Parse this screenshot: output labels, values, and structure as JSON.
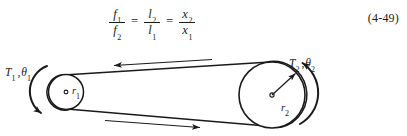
{
  "equation": {
    "id": "4-49",
    "number_label": "(4-49)",
    "relation": "f1/f2 = l2/l1 = x2/x1",
    "terms": [
      {
        "numerator_symbol": "f",
        "numerator_sub": "1",
        "denominator_symbol": "f",
        "denominator_sub": "2"
      },
      {
        "numerator_symbol": "l",
        "numerator_sub": "2",
        "denominator_symbol": "l",
        "denominator_sub": "1"
      },
      {
        "numerator_symbol": "x",
        "numerator_sub": "2",
        "denominator_symbol": "x",
        "denominator_sub": "1"
      }
    ],
    "operators": [
      "=",
      "="
    ]
  },
  "figure": {
    "type": "belt-and-pulley-drive",
    "labels": {
      "left_torque_symbol": "T",
      "left_torque_sub": "1",
      "left_angle_symbol": "θ",
      "left_angle_sub": "1",
      "right_torque_symbol": "T",
      "right_torque_sub": "2",
      "right_angle_symbol": "θ",
      "right_angle_sub": "2",
      "left_radius_symbol": "r",
      "left_radius_sub": "1",
      "right_radius_symbol": "r",
      "right_radius_sub": "2",
      "separator": ","
    },
    "pulleys": [
      {
        "name": "small-pulley",
        "cx": 66,
        "cy": 48,
        "r": 17.5,
        "radius_label": "r1"
      },
      {
        "name": "large-pulley",
        "cx": 272,
        "cy": 51,
        "r": 33.0,
        "radius_label": "r2"
      }
    ],
    "belt": {
      "top_arrow_direction": "left",
      "bottom_arrow_direction": "right"
    },
    "torque_arcs": [
      {
        "name": "left-torque-arc",
        "direction": "counterclockwise-downward"
      },
      {
        "name": "right-torque-arc",
        "direction": "counterclockwise-upward"
      }
    ],
    "colors": {
      "ink": "#1a1a1a",
      "background": "#ffffff"
    }
  }
}
